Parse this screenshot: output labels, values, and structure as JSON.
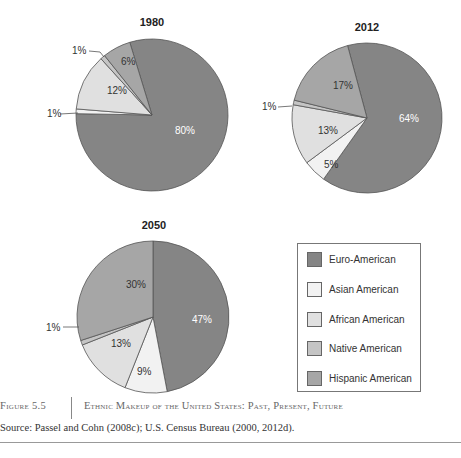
{
  "chart_data": [
    {
      "type": "pie",
      "title": "1980",
      "labels": [
        "Euro-American",
        "Asian American",
        "African American",
        "Native American",
        "Hispanic American"
      ],
      "values": [
        80,
        1,
        12,
        1,
        6
      ]
    },
    {
      "type": "pie",
      "title": "2012",
      "labels": [
        "Euro-American",
        "Asian American",
        "African American",
        "Native American",
        "Hispanic American"
      ],
      "values": [
        64,
        5,
        13,
        1,
        17
      ]
    },
    {
      "type": "pie",
      "title": "2050",
      "labels": [
        "Euro-American",
        "Asian American",
        "African American",
        "Native American",
        "Hispanic American"
      ],
      "values": [
        47,
        9,
        13,
        1,
        30
      ]
    }
  ],
  "pies": [
    {
      "title": "1980",
      "cx": 152,
      "cy": 115,
      "r": 76,
      "start_deg": -17,
      "slices": [
        {
          "key": "euro",
          "value": 80,
          "label": "80%",
          "lx": 175,
          "ly": 134,
          "label_color": "#ffffff"
        },
        {
          "key": "asian",
          "value": 1,
          "label": "1%",
          "callout": true,
          "lx": 47,
          "ly": 117,
          "line": [
            60,
            114,
            78,
            113
          ]
        },
        {
          "key": "african",
          "value": 12,
          "label": "12%",
          "lx": 107,
          "ly": 94
        },
        {
          "key": "native",
          "value": 1,
          "label": "1%",
          "callout": true,
          "lx": 72,
          "ly": 54,
          "line": [
            89,
            51,
            100,
            52,
            104,
            57
          ]
        },
        {
          "key": "hispanic",
          "value": 6,
          "label": "6%",
          "lx": 121,
          "ly": 65
        }
      ]
    },
    {
      "title": "2012",
      "cx": 367,
      "cy": 118,
      "r": 75,
      "start_deg": -15,
      "slices": [
        {
          "key": "euro",
          "value": 64,
          "label": "64%",
          "lx": 399,
          "ly": 122,
          "label_color": "#ffffff"
        },
        {
          "key": "asian",
          "value": 5,
          "label": "5%",
          "lx": 324,
          "ly": 168
        },
        {
          "key": "african",
          "value": 13,
          "label": "13%",
          "lx": 318,
          "ly": 134
        },
        {
          "key": "native",
          "value": 1,
          "label": "1%",
          "callout": true,
          "lx": 262,
          "ly": 110,
          "line": [
            278,
            107,
            292,
            106
          ]
        },
        {
          "key": "hispanic",
          "value": 17,
          "label": "17%",
          "lx": 333,
          "ly": 89
        }
      ]
    },
    {
      "title": "2050",
      "cx": 153,
      "cy": 317,
      "r": 76,
      "start_deg": 0,
      "slices": [
        {
          "key": "euro",
          "value": 47,
          "label": "47%",
          "lx": 192,
          "ly": 323,
          "label_color": "#ffffff"
        },
        {
          "key": "asian",
          "value": 9,
          "label": "9%",
          "lx": 137,
          "ly": 375
        },
        {
          "key": "african",
          "value": 13,
          "label": "13%",
          "lx": 111,
          "ly": 347
        },
        {
          "key": "native",
          "value": 1,
          "label": "1%",
          "callout": true,
          "lx": 46,
          "ly": 331,
          "line": [
            63,
            327,
            79,
            327
          ]
        },
        {
          "key": "hispanic",
          "value": 30,
          "label": "30%",
          "lx": 126,
          "ly": 288
        }
      ]
    }
  ],
  "colors": {
    "euro": "#858585",
    "asian": "#f2f2f2",
    "african": "#e0e0e0",
    "native": "#c4c4c4",
    "hispanic": "#a6a6a6",
    "outline": "#555555",
    "text": "#333333"
  },
  "legend": {
    "items": [
      {
        "key": "euro",
        "label": "Euro-American"
      },
      {
        "key": "asian",
        "label": "Asian American"
      },
      {
        "key": "african",
        "label": "African American"
      },
      {
        "key": "native",
        "label": "Native American"
      },
      {
        "key": "hispanic",
        "label": "Hispanic American"
      }
    ]
  },
  "caption": {
    "figure_number": "Figure 5.5",
    "title": "Ethnic Makeup of the United States: Past, Present, Future",
    "source": "Source: Passel and Cohn (2008c); U.S. Census Bureau (2000, 2012d)."
  }
}
